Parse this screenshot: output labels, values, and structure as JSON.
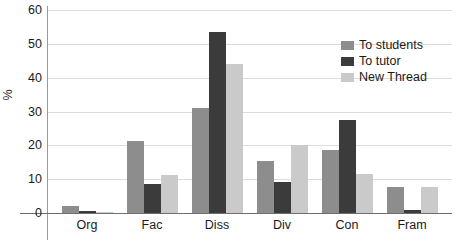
{
  "chart_data": {
    "type": "bar",
    "title": "",
    "xlabel": "",
    "ylabel": "%",
    "ylim": [
      0,
      60
    ],
    "yticks": [
      0,
      10,
      20,
      30,
      40,
      50,
      60
    ],
    "grid": true,
    "legend_position": "upper-right",
    "categories": [
      "Org",
      "Fac",
      "Diss",
      "Div",
      "Con",
      "Fram"
    ],
    "series": [
      {
        "name": "To students",
        "color": "#8d8d8d",
        "values": [
          2.0,
          21.2,
          31.0,
          15.5,
          18.7,
          7.6
        ]
      },
      {
        "name": "To tutor",
        "color": "#3b3b3b",
        "values": [
          0.6,
          8.6,
          53.5,
          9.1,
          27.4,
          1.0
        ]
      },
      {
        "name": "New Thread",
        "color": "#cacaca",
        "values": [
          0.3,
          11.2,
          44.0,
          20.0,
          11.6,
          7.6
        ]
      }
    ]
  }
}
